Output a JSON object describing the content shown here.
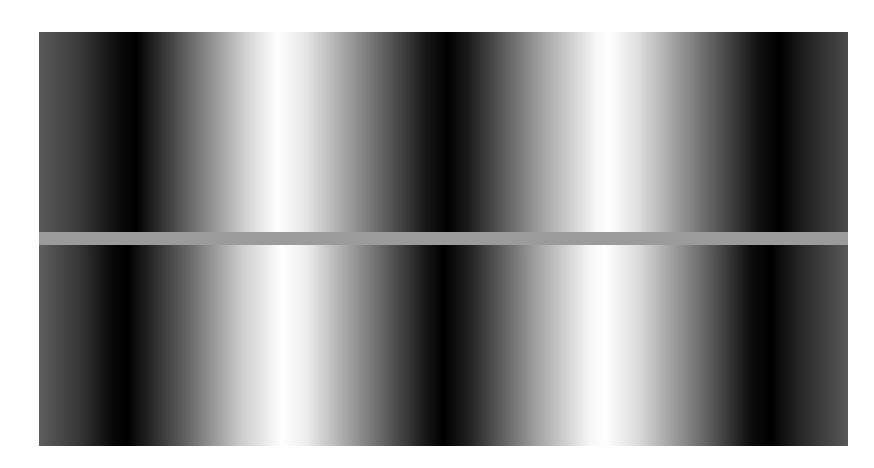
{
  "figure": {
    "top_strip": {
      "stops": [
        {
          "pos": 0,
          "color": "#5a5a5a"
        },
        {
          "pos": 5,
          "color": "#3a3a3a"
        },
        {
          "pos": 10,
          "color": "#0a0a0a"
        },
        {
          "pos": 12,
          "color": "#000000"
        },
        {
          "pos": 19,
          "color": "#6e6e6e"
        },
        {
          "pos": 26,
          "color": "#d8d8d8"
        },
        {
          "pos": 29.5,
          "color": "#ffffff"
        },
        {
          "pos": 33,
          "color": "#e6e6e6"
        },
        {
          "pos": 41,
          "color": "#777777"
        },
        {
          "pos": 48,
          "color": "#151515"
        },
        {
          "pos": 50.5,
          "color": "#000000"
        },
        {
          "pos": 53,
          "color": "#1a1a1a"
        },
        {
          "pos": 62,
          "color": "#a0a0a0"
        },
        {
          "pos": 69,
          "color": "#f8f8f8"
        },
        {
          "pos": 70.5,
          "color": "#ffffff"
        },
        {
          "pos": 74,
          "color": "#e0e0e0"
        },
        {
          "pos": 82,
          "color": "#707070"
        },
        {
          "pos": 89,
          "color": "#101010"
        },
        {
          "pos": 91.5,
          "color": "#000000"
        },
        {
          "pos": 95,
          "color": "#222222"
        },
        {
          "pos": 100,
          "color": "#4a4a4a"
        }
      ]
    },
    "band": {
      "color": "#9b9b9b"
    },
    "bottom_strip": {
      "stops": [
        {
          "pos": 0,
          "color": "#5e5e5e"
        },
        {
          "pos": 5,
          "color": "#363636"
        },
        {
          "pos": 9,
          "color": "#080808"
        },
        {
          "pos": 11,
          "color": "#000000"
        },
        {
          "pos": 18,
          "color": "#606060"
        },
        {
          "pos": 25,
          "color": "#cccccc"
        },
        {
          "pos": 30,
          "color": "#ffffff"
        },
        {
          "pos": 33,
          "color": "#eeeeee"
        },
        {
          "pos": 41,
          "color": "#7a7a7a"
        },
        {
          "pos": 48,
          "color": "#141414"
        },
        {
          "pos": 50,
          "color": "#000000"
        },
        {
          "pos": 53,
          "color": "#1e1e1e"
        },
        {
          "pos": 62,
          "color": "#a8a8a8"
        },
        {
          "pos": 68,
          "color": "#f6f6f6"
        },
        {
          "pos": 70,
          "color": "#ffffff"
        },
        {
          "pos": 74,
          "color": "#dcdcdc"
        },
        {
          "pos": 82,
          "color": "#6a6a6a"
        },
        {
          "pos": 88,
          "color": "#0c0c0c"
        },
        {
          "pos": 90.5,
          "color": "#000000"
        },
        {
          "pos": 94,
          "color": "#262626"
        },
        {
          "pos": 100,
          "color": "#585858"
        }
      ]
    }
  }
}
